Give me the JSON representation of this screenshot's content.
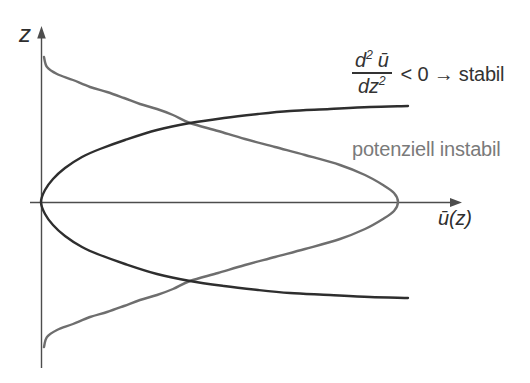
{
  "axis": {
    "z_label": "z",
    "u_label": "ū(z)"
  },
  "formula": {
    "num_d": "d",
    "num_sup": "2",
    "num_u": "ū",
    "den": "dz",
    "den_sup": "2",
    "condition": "< 0 → stabil"
  },
  "unstable_label": "potenziell instabil",
  "colors": {
    "curve_dark": "#2e2e2e",
    "curve_gray": "#6e6e6e",
    "axis": "#4d4d4d",
    "text_dark": "#333333",
    "text_gray": "#7a7a7a",
    "background": "#ffffff"
  },
  "chart_data": {
    "type": "line",
    "title": "",
    "xlabel": "ū(z)",
    "ylabel": "z",
    "qualitative": true,
    "series": [
      {
        "name": "velocity profile without inflection point (d²ū/dz² < 0 → stabil)",
        "color": "#2e2e2e",
        "width": 2.4,
        "points_px": [
          [
            408,
            106
          ],
          [
            370,
            107
          ],
          [
            330,
            109
          ],
          [
            290,
            111
          ],
          [
            258,
            114
          ],
          [
            224,
            118
          ],
          [
            190,
            123
          ],
          [
            157,
            130
          ],
          [
            125,
            140
          ],
          [
            100,
            149
          ],
          [
            82,
            157
          ],
          [
            65,
            168
          ],
          [
            53,
            179
          ],
          [
            45,
            190
          ],
          [
            41,
            202
          ],
          [
            45,
            214
          ],
          [
            53,
            225
          ],
          [
            65,
            236
          ],
          [
            82,
            247
          ],
          [
            100,
            255
          ],
          [
            125,
            264
          ],
          [
            157,
            274
          ],
          [
            190,
            281
          ],
          [
            224,
            286
          ],
          [
            258,
            290
          ],
          [
            290,
            293
          ],
          [
            330,
            295
          ],
          [
            370,
            297
          ],
          [
            408,
            298
          ]
        ]
      },
      {
        "name": "jet profile with inflection points (potenziell instabil)",
        "color": "#6e6e6e",
        "width": 2.4,
        "points_px": [
          [
            44,
            57
          ],
          [
            47,
            67
          ],
          [
            57,
            74
          ],
          [
            73,
            80
          ],
          [
            90,
            87
          ],
          [
            107,
            92
          ],
          [
            124,
            98
          ],
          [
            140,
            104
          ],
          [
            157,
            109
          ],
          [
            173,
            115
          ],
          [
            190,
            123
          ],
          [
            218,
            131
          ],
          [
            245,
            139
          ],
          [
            275,
            147
          ],
          [
            305,
            155
          ],
          [
            340,
            165
          ],
          [
            365,
            175
          ],
          [
            383,
            185
          ],
          [
            394,
            193
          ],
          [
            398,
            202
          ],
          [
            394,
            211
          ],
          [
            383,
            219
          ],
          [
            365,
            229
          ],
          [
            340,
            239
          ],
          [
            305,
            249
          ],
          [
            275,
            257
          ],
          [
            245,
            265
          ],
          [
            218,
            273
          ],
          [
            190,
            281
          ],
          [
            173,
            289
          ],
          [
            157,
            295
          ],
          [
            140,
            300
          ],
          [
            124,
            306
          ],
          [
            107,
            312
          ],
          [
            90,
            317
          ],
          [
            73,
            324
          ],
          [
            57,
            330
          ],
          [
            47,
            337
          ],
          [
            44,
            347
          ]
        ]
      }
    ]
  }
}
